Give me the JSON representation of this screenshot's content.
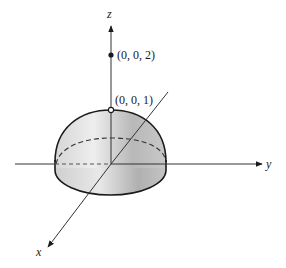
{
  "figure": {
    "type": "3d-solid-diagram",
    "solid": "hemisphere",
    "axes": {
      "x_label": "x",
      "y_label": "y",
      "z_label": "z"
    },
    "points": [
      {
        "label": "(0, 0, 2)",
        "marker": "filled"
      },
      {
        "label": "(0, 0, 1)",
        "marker": "open"
      }
    ],
    "colors": {
      "line": "#1a1a1a",
      "shade_light": "#e6e6e6",
      "shade_dark": "#a9a9a9",
      "background": "#ffffff"
    }
  }
}
